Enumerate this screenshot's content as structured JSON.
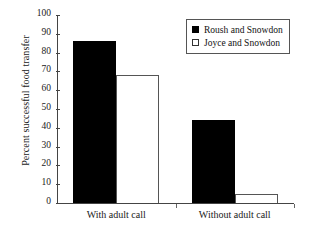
{
  "chart_data": {
    "type": "bar",
    "title": "",
    "subtitle": "",
    "xlabel": "",
    "ylabel": "Percent successful food transfer",
    "categories": [
      "With adult call",
      "Without adult call"
    ],
    "series": [
      {
        "name": "Roush and Snowdon",
        "values": [
          86,
          44
        ],
        "color": "#000000",
        "style": "filled"
      },
      {
        "name": "Joyce and Snowdon",
        "values": [
          68,
          5
        ],
        "color": "#ffffff",
        "style": "open"
      }
    ],
    "ylim": [
      0,
      100
    ],
    "ytick_labels": [
      "100",
      "90",
      "80",
      "70",
      "60",
      "50",
      "40",
      "30",
      "20",
      "10",
      "0"
    ],
    "ytick_values": [
      100,
      90,
      80,
      70,
      60,
      50,
      40,
      30,
      20,
      10,
      0
    ],
    "grid": false,
    "legend_position": "top-right",
    "legend_entries": [
      "Roush and Snowdon",
      "Joyce and Snowdon"
    ]
  },
  "colors": {
    "axis": "#444444",
    "text": "#1a1a1a",
    "filled_bar": "#000000",
    "open_bar": "#ffffff",
    "open_bar_border": "#555555",
    "legend_border": "#555555",
    "background": "#ffffff"
  }
}
